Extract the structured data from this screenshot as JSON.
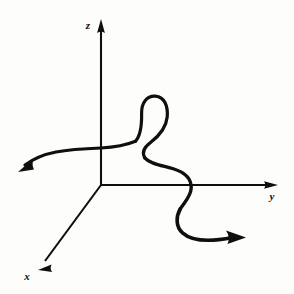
{
  "figure": {
    "background_color": "#fdfdfc",
    "ink_color": "#100f0d",
    "axes": {
      "origin": {
        "x": 101,
        "y": 185
      },
      "items": [
        {
          "name": "z-axis",
          "label": "z",
          "label_x": 89,
          "label_y": 28,
          "direction": "up",
          "from": {
            "x": 101,
            "y": 185
          },
          "to": {
            "x": 101,
            "y": 21
          },
          "arrowhead": true
        },
        {
          "name": "y-axis",
          "label": "y",
          "label_x": 273,
          "label_y": 198,
          "direction": "right",
          "from": {
            "x": 101,
            "y": 185
          },
          "to": {
            "x": 277,
            "y": 185
          },
          "arrowhead": true
        },
        {
          "name": "x-axis",
          "label": "x",
          "label_x": 28,
          "label_y": 278,
          "direction": "down-left",
          "from": {
            "x": 101,
            "y": 185
          },
          "to": {
            "x": 39,
            "y": 269
          },
          "arrowhead": true
        }
      ]
    },
    "curve": {
      "name": "space-curve",
      "stroke_color": "#100f0d",
      "start_arrowhead": {
        "position": {
          "x": 22,
          "y": 166
        },
        "direction": "down-left"
      },
      "end_arrowhead": {
        "position": {
          "x": 243,
          "y": 238
        },
        "direction": "right"
      },
      "self_intersection": {
        "x": 136,
        "y": 141
      },
      "loop_apex": {
        "x": 150,
        "y": 96
      },
      "crosses_z_axis_at": {
        "x": 101,
        "y": 148
      },
      "crosses_y_axis_at": {
        "x": 189,
        "y": 185
      },
      "path_points": [
        {
          "x": 27,
          "y": 163
        },
        {
          "x": 45,
          "y": 155
        },
        {
          "x": 62,
          "y": 151
        },
        {
          "x": 85,
          "y": 149
        },
        {
          "x": 101,
          "y": 148
        },
        {
          "x": 120,
          "y": 145
        },
        {
          "x": 136,
          "y": 141
        },
        {
          "x": 146,
          "y": 130
        },
        {
          "x": 143,
          "y": 110
        },
        {
          "x": 152,
          "y": 97
        },
        {
          "x": 165,
          "y": 103
        },
        {
          "x": 166,
          "y": 121
        },
        {
          "x": 152,
          "y": 138
        },
        {
          "x": 143,
          "y": 150
        },
        {
          "x": 150,
          "y": 161
        },
        {
          "x": 172,
          "y": 166
        },
        {
          "x": 188,
          "y": 176
        },
        {
          "x": 191,
          "y": 191
        },
        {
          "x": 182,
          "y": 205
        },
        {
          "x": 177,
          "y": 219
        },
        {
          "x": 186,
          "y": 232
        },
        {
          "x": 205,
          "y": 239
        },
        {
          "x": 228,
          "y": 238
        }
      ]
    }
  }
}
